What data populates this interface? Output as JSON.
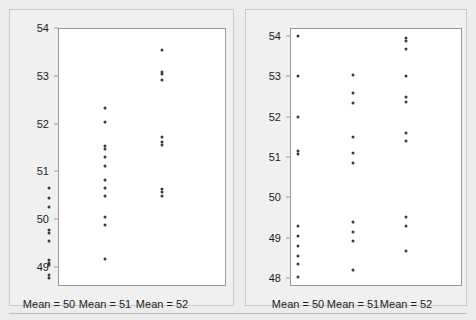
{
  "figure": {
    "background_color": "#ececed",
    "panel_background": "#f0f0f0",
    "plot_background": "#ffffff",
    "dot_color": "#3b3b3b",
    "axis_color": "#9a9a9a"
  },
  "chart_data": [
    {
      "type": "scatter",
      "panel": "left",
      "title": "",
      "xlabel": "",
      "ylabel": "",
      "grid": false,
      "legend": null,
      "ylim": [
        48.6,
        54.0
      ],
      "yticks": [
        49,
        50,
        51,
        52,
        53,
        54
      ],
      "ytick_labels": [
        "49",
        "50",
        "51",
        "52",
        "53",
        "54"
      ],
      "categories": [
        "Mean = 50",
        "Mean = 51",
        "Mean = 52"
      ],
      "series": [
        {
          "name": "Mean = 50",
          "values": [
            50.65,
            50.45,
            50.25,
            49.78,
            49.7,
            49.55,
            49.14,
            49.09,
            49.03,
            48.82,
            48.76
          ]
        },
        {
          "name": "Mean = 51",
          "values": [
            52.32,
            52.03,
            51.52,
            51.46,
            51.3,
            51.11,
            50.82,
            50.66,
            50.49,
            50.05,
            49.87,
            49.16
          ]
        },
        {
          "name": "Mean = 52",
          "values": [
            53.55,
            53.08,
            53.03,
            52.92,
            51.72,
            51.62,
            51.55,
            50.62,
            50.56,
            50.49
          ]
        }
      ]
    },
    {
      "type": "scatter",
      "panel": "right",
      "title": "",
      "xlabel": "",
      "ylabel": "",
      "grid": false,
      "legend": null,
      "ylim": [
        47.8,
        54.2
      ],
      "yticks": [
        48,
        49,
        50,
        51,
        52,
        53,
        54
      ],
      "ytick_labels": [
        "48",
        "49",
        "50",
        "51",
        "52",
        "53",
        "54"
      ],
      "categories": [
        "Mean = 50",
        "Mean = 51",
        "Mean = 52"
      ],
      "series": [
        {
          "name": "Mean = 50",
          "values": [
            54.0,
            53.0,
            52.0,
            51.15,
            51.08,
            49.28,
            49.03,
            48.78,
            48.55,
            48.35,
            48.03
          ]
        },
        {
          "name": "Mean = 51",
          "values": [
            53.03,
            52.6,
            52.35,
            51.5,
            51.1,
            50.85,
            49.4,
            49.13,
            48.92,
            48.2
          ]
        },
        {
          "name": "Mean = 52",
          "values": [
            53.95,
            53.88,
            53.68,
            53.0,
            52.48,
            52.37,
            51.6,
            51.4,
            49.52,
            49.3,
            48.68
          ]
        }
      ]
    }
  ]
}
